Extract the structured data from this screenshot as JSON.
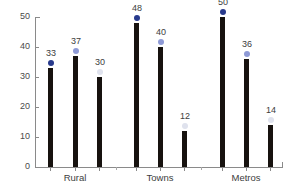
{
  "chart_data": {
    "type": "bar",
    "title": "",
    "subtitle": "",
    "xlabel": "",
    "ylabel": "",
    "ylim": [
      0,
      50
    ],
    "y_ticks": [
      0,
      10,
      20,
      30,
      40,
      50
    ],
    "grid": false,
    "legend_position": "none",
    "categories": [
      "Rural",
      "Towns",
      "Metros"
    ],
    "series": [
      {
        "name": "series-1",
        "color": "#283a8c",
        "values": [
          33,
          48,
          50
        ]
      },
      {
        "name": "series-2",
        "color": "#8e9ad6",
        "values": [
          37,
          40,
          36
        ]
      },
      {
        "name": "series-3",
        "color": "#dfe2ed",
        "values": [
          30,
          12,
          14
        ]
      }
    ],
    "bars": [
      {
        "group": "Rural",
        "series": 0,
        "value": 33,
        "label": "33",
        "marker_color": "#283a8c"
      },
      {
        "group": "Rural",
        "series": 1,
        "value": 37,
        "label": "37",
        "marker_color": "#8e9ad6"
      },
      {
        "group": "Rural",
        "series": 2,
        "value": 30,
        "label": "30",
        "marker_color": "#dfe2ed"
      },
      {
        "group": "Towns",
        "series": 0,
        "value": 48,
        "label": "48",
        "marker_color": "#283a8c"
      },
      {
        "group": "Towns",
        "series": 1,
        "value": 40,
        "label": "40",
        "marker_color": "#8e9ad6"
      },
      {
        "group": "Towns",
        "series": 2,
        "value": 12,
        "label": "12",
        "marker_color": "#dfe2ed"
      },
      {
        "group": "Metros",
        "series": 0,
        "value": 50,
        "label": "50",
        "marker_color": "#283a8c"
      },
      {
        "group": "Metros",
        "series": 1,
        "value": 36,
        "label": "36",
        "marker_color": "#8e9ad6"
      },
      {
        "group": "Metros",
        "series": 2,
        "value": 14,
        "label": "14",
        "marker_color": "#dfe2ed"
      }
    ],
    "bar_color": "#17120f",
    "axis_color": "#8a8a8a",
    "text_color": "#3d3d3d"
  },
  "axis": {
    "y_labels": [
      "50",
      "40",
      "30",
      "20",
      "10",
      "0"
    ]
  },
  "groups": [
    {
      "label": "Rural"
    },
    {
      "label": "Towns"
    },
    {
      "label": "Metros"
    }
  ]
}
